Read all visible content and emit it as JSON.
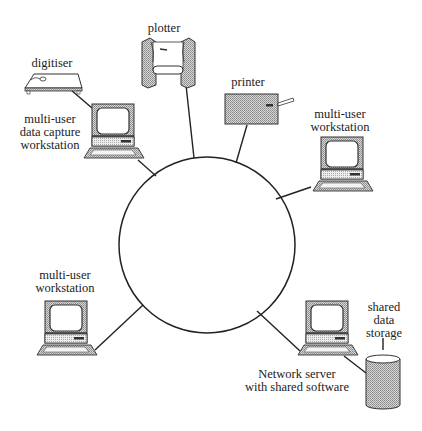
{
  "diagram": {
    "type": "ring network topology",
    "ring": {
      "label": ""
    },
    "nodes": [
      {
        "id": "digitiser",
        "label_lines": [
          "digitiser"
        ],
        "icon": "digitiser-tablet-icon"
      },
      {
        "id": "data-capture-workstation",
        "label_lines": [
          "multi-user",
          "data capture",
          "workstation"
        ],
        "icon": "workstation-icon"
      },
      {
        "id": "plotter",
        "label_lines": [
          "plotter"
        ],
        "icon": "plotter-icon"
      },
      {
        "id": "printer",
        "label_lines": [
          "printer"
        ],
        "icon": "printer-icon"
      },
      {
        "id": "right-workstation",
        "label_lines": [
          "multi-user",
          "workstation"
        ],
        "icon": "workstation-icon"
      },
      {
        "id": "left-workstation",
        "label_lines": [
          "multi-user",
          "workstation"
        ],
        "icon": "workstation-icon"
      },
      {
        "id": "network-server",
        "label_lines": [
          "Network server",
          "with shared software"
        ],
        "icon": "workstation-icon"
      },
      {
        "id": "shared-storage",
        "label_lines": [
          "shared",
          "data",
          "storage"
        ],
        "icon": "storage-cylinder-icon"
      }
    ],
    "connections": [
      [
        "ring",
        "plotter"
      ],
      [
        "ring",
        "printer"
      ],
      [
        "ring",
        "right-workstation"
      ],
      [
        "ring",
        "data-capture-workstation"
      ],
      [
        "data-capture-workstation",
        "digitiser"
      ],
      [
        "ring",
        "left-workstation"
      ],
      [
        "ring",
        "network-server"
      ],
      [
        "network-server",
        "shared-storage"
      ]
    ]
  }
}
